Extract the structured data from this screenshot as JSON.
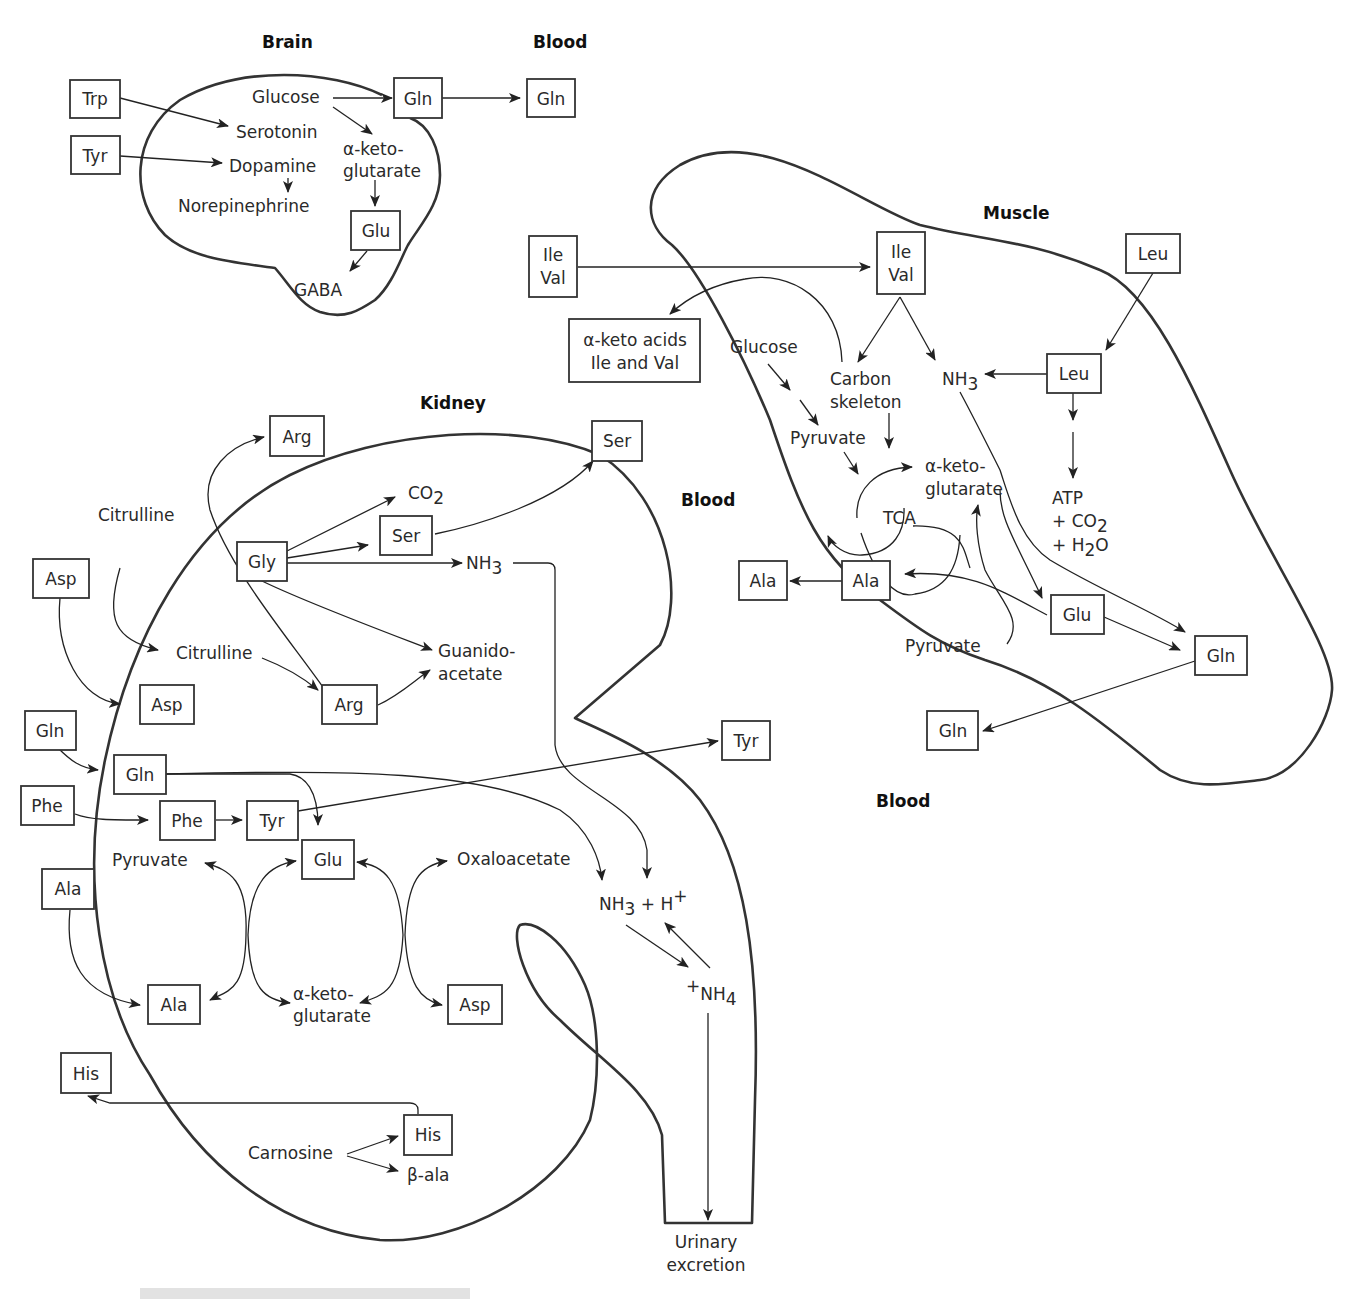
{
  "regions": {
    "brain": "Brain",
    "blood_top": "Blood",
    "muscle": "Muscle",
    "kidney": "Kidney",
    "blood_mid": "Blood",
    "blood_bottom": "Blood"
  },
  "brain": {
    "trp": "Trp",
    "tyr": "Tyr",
    "glucose": "Glucose",
    "serotonin": "Serotonin",
    "dopamine": "Dopamine",
    "norepinephrine": "Norepinephrine",
    "akg_1": "α-keto-",
    "akg_2": "glutarate",
    "gln": "Gln",
    "glu": "Glu",
    "gaba": "GABA",
    "blood_gln": "Gln"
  },
  "muscle": {
    "ile_val_blood_1": "Ile",
    "ile_val_blood_2": "Val",
    "ile_val_1": "Ile",
    "ile_val_2": "Val",
    "keto_acids_1": "α-keto acids",
    "keto_acids_2": "Ile and Val",
    "glucose": "Glucose",
    "carbon_1": "Carbon",
    "carbon_2": "skeleton",
    "nh3": "NH",
    "nh3_sub": "3",
    "leu_blood": "Leu",
    "leu": "Leu",
    "pyruvate_top": "Pyruvate",
    "akg_1": "α-keto-",
    "akg_2": "glutarate",
    "tca": "TCA",
    "atp": "ATP",
    "co2": "+ CO",
    "co2_sub": "2",
    "h2o_pre": "+ H",
    "h2o_sub": "2",
    "h2o_post": "O",
    "ala_blood": "Ala",
    "ala": "Ala",
    "glu": "Glu",
    "pyruvate_bottom": "Pyruvate",
    "gln": "Gln",
    "gln_blood": "Gln"
  },
  "kidney": {
    "arg_blood": "Arg",
    "ser_blood": "Ser",
    "co2": "CO",
    "co2_sub": "2",
    "citrulline_blood": "Citrulline",
    "ser": "Ser",
    "gly": "Gly",
    "nh3": "NH",
    "nh3_sub": "3",
    "asp_blood": "Asp",
    "citrulline": "Citrulline",
    "guanido_1": "Guanido-",
    "guanido_2": "acetate",
    "asp": "Asp",
    "arg": "Arg",
    "gln_blood": "Gln",
    "gln": "Gln",
    "tyr_blood": "Tyr",
    "phe_blood": "Phe",
    "phe": "Phe",
    "tyr": "Tyr",
    "pyruvate": "Pyruvate",
    "glu": "Glu",
    "oxaloacetate": "Oxaloacetate",
    "nh3_h_pre": "NH",
    "nh3_h_sub": "3",
    "nh3_h_mid": " + H",
    "nh3_h_sup": "+",
    "ala_blood": "Ala",
    "nh4_sup": "+",
    "nh4": "NH",
    "nh4_sub": "4",
    "ala": "Ala",
    "akg_1": "α-keto-",
    "akg_2": "glutarate",
    "asp_prod": "Asp",
    "his_blood": "His",
    "his": "His",
    "carnosine": "Carnosine",
    "beta_ala": "β-ala",
    "urinary_1": "Urinary",
    "urinary_2": "excretion"
  }
}
